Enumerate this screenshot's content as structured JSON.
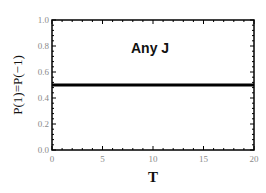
{
  "chart_data": {
    "type": "line",
    "title": "",
    "xlabel": "T",
    "ylabel": "P(1)=P(−1)",
    "xlim": [
      0,
      20
    ],
    "ylim": [
      0.0,
      1.0
    ],
    "x_ticks": [
      "0",
      "5",
      "10",
      "15",
      "20"
    ],
    "y_ticks": [
      "0.0",
      "0.2",
      "0.4",
      "0.6",
      "0.8",
      "1.0"
    ],
    "grid": false,
    "legend": null,
    "annotations": [
      {
        "text": "Any J",
        "x": 10,
        "y": 0.8
      }
    ],
    "series": [
      {
        "name": "P(1)=P(-1)",
        "x": [
          0,
          5,
          10,
          15,
          20
        ],
        "values": [
          0.5,
          0.5,
          0.5,
          0.5,
          0.5
        ],
        "color": "#000000"
      }
    ]
  }
}
